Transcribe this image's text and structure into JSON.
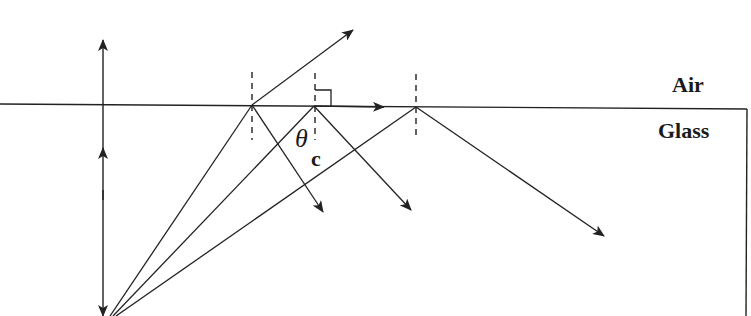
{
  "diagram": {
    "type": "total internal reflection / critical angle",
    "media": {
      "upper": "Air",
      "lower": "Glass"
    },
    "angle_label": {
      "symbol": "θ",
      "subscript": "c"
    },
    "colors": {
      "stroke": "#222222",
      "background": "#ffffff"
    },
    "rays": [
      {
        "id": "ray-1",
        "behavior": "refracted into air and partially reflected"
      },
      {
        "id": "ray-2",
        "behavior": "at critical angle, refracted along surface (90°)"
      },
      {
        "id": "ray-3",
        "behavior": "totally internally reflected"
      }
    ]
  }
}
